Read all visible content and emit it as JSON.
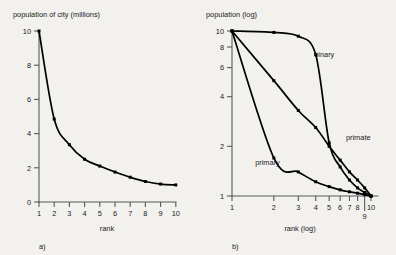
{
  "figure": {
    "background_color": "#f2f1ee",
    "curve_color": "#000000",
    "axis_color": "#58585a"
  },
  "panel_a": {
    "label": "a)",
    "ylabel": "population of city (millions)",
    "xlabel": "rank",
    "y_ticks": [
      "0",
      "2",
      "4",
      "6",
      "8",
      "10"
    ],
    "x_ticks": [
      "1",
      "2",
      "3",
      "4",
      "5",
      "6",
      "7",
      "8",
      "9",
      "10"
    ]
  },
  "panel_b": {
    "label": "b)",
    "ylabel": "population (log)",
    "xlabel": "rank (log)",
    "y_ticks": [
      "1",
      "2",
      "4",
      "6",
      "8",
      "10"
    ],
    "x_ticks": [
      "1",
      "2",
      "3",
      "4",
      "5",
      "6",
      "7",
      "8",
      "9",
      "10"
    ],
    "curve_labels": {
      "binary": "binary",
      "primate": "primate",
      "primary": "primary"
    }
  },
  "chart_data": [
    {
      "type": "line",
      "title": "",
      "panel": "a",
      "xlabel": "rank",
      "ylabel": "population of city (millions)",
      "xscale": "linear",
      "yscale": "linear",
      "xlim": [
        1,
        10
      ],
      "ylim": [
        0,
        10
      ],
      "xticks": [
        1,
        2,
        3,
        4,
        5,
        6,
        7,
        8,
        9,
        10
      ],
      "yticks": [
        0,
        2,
        4,
        6,
        8,
        10
      ],
      "grid": false,
      "legend": "none",
      "markers": true,
      "series": [
        {
          "name": "rank-size",
          "x": [
            1,
            2,
            3,
            4,
            5,
            6,
            7,
            8,
            9,
            10
          ],
          "values": [
            10.0,
            4.85,
            3.35,
            2.5,
            2.1,
            1.75,
            1.45,
            1.2,
            1.05,
            1.0
          ]
        }
      ]
    },
    {
      "type": "line",
      "title": "",
      "panel": "b",
      "xlabel": "rank (log)",
      "ylabel": "population (log)",
      "xscale": "log",
      "yscale": "log",
      "xlim": [
        1,
        10
      ],
      "ylim": [
        1,
        10
      ],
      "xticks": [
        1,
        2,
        3,
        4,
        5,
        6,
        7,
        8,
        9,
        10
      ],
      "yticks": [
        1,
        2,
        4,
        6,
        8,
        10
      ],
      "grid": false,
      "legend": "inline-annotations",
      "markers": true,
      "series": [
        {
          "name": "binary",
          "x": [
            1,
            2,
            3,
            4,
            5,
            6,
            7,
            8,
            9,
            10
          ],
          "values": [
            10.0,
            9.8,
            9.3,
            7.2,
            2.1,
            1.5,
            1.25,
            1.12,
            1.05,
            1.0
          ]
        },
        {
          "name": "primate",
          "x": [
            1,
            2,
            3,
            4,
            5,
            6,
            7,
            8,
            9,
            10
          ],
          "values": [
            10.0,
            5.0,
            3.3,
            2.6,
            2.0,
            1.65,
            1.4,
            1.25,
            1.12,
            1.0
          ]
        },
        {
          "name": "primary",
          "x": [
            1,
            2,
            3,
            4,
            5,
            6,
            7,
            8,
            9,
            10
          ],
          "values": [
            10.0,
            1.7,
            1.4,
            1.22,
            1.14,
            1.09,
            1.06,
            1.04,
            1.02,
            1.0
          ]
        }
      ],
      "annotations": [
        {
          "text": "binary",
          "x": 3.9,
          "y": 7.0
        },
        {
          "text": "primate",
          "x": 6.6,
          "y": 2.2
        },
        {
          "text": "primary",
          "x": 1.8,
          "y": 1.55
        }
      ]
    }
  ]
}
